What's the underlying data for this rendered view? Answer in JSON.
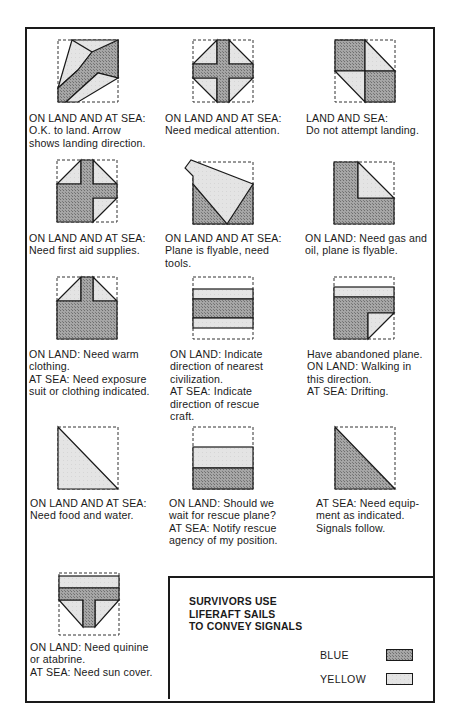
{
  "colors": {
    "blue": "#9a9a9a",
    "yellow": "#e3e3e3",
    "line": "#1a1a1a"
  },
  "signals": [
    {
      "id": "ok-to-land",
      "lines": [
        "ON LAND AND AT SEA:",
        "O.K. to land. Arrow",
        "shows landing direction."
      ]
    },
    {
      "id": "medical-attention",
      "lines": [
        "ON LAND AND AT SEA:",
        "Need medical attention."
      ]
    },
    {
      "id": "do-not-land",
      "lines": [
        "LAND AND SEA:",
        "Do not attempt landing."
      ]
    },
    {
      "id": "first-aid",
      "lines": [
        "ON LAND AND AT SEA:",
        "Need first aid supplies."
      ]
    },
    {
      "id": "need-tools",
      "lines": [
        "ON LAND AND AT SEA:",
        "Plane is flyable, need",
        "tools."
      ]
    },
    {
      "id": "gas-and-oil",
      "lines": [
        "ON LAND: Need gas and",
        "oil, plane is flyable."
      ]
    },
    {
      "id": "warm-clothing",
      "lines": [
        "ON LAND: Need warm",
        "clothing.",
        "AT SEA: Need exposure",
        "suit or clothing indicated."
      ]
    },
    {
      "id": "direction",
      "lines": [
        "ON LAND: Indicate",
        "direction of nearest",
        "civilization.",
        "AT SEA: Indicate",
        "direction of rescue",
        "craft."
      ]
    },
    {
      "id": "abandoned-plane",
      "lines": [
        "Have abandoned plane.",
        "ON LAND: Walking in",
        "this direction.",
        "AT SEA: Drifting."
      ]
    },
    {
      "id": "food-water",
      "lines": [
        "ON LAND AND AT SEA:",
        "Need food and water."
      ]
    },
    {
      "id": "wait-or-notify",
      "lines": [
        "ON LAND: Should we",
        "wait for rescue plane?",
        "AT SEA: Notify rescue",
        "agency of my position."
      ]
    },
    {
      "id": "equipment",
      "lines": [
        "AT SEA: Need equip-",
        "ment as indicated.",
        "Signals follow."
      ]
    },
    {
      "id": "quinine-sun-cover",
      "lines": [
        "ON LAND: Need quinine",
        "or atabrine.",
        "AT SEA: Need sun cover."
      ]
    }
  ],
  "legend": {
    "title_lines": [
      "SURVIVORS USE",
      "LIFERAFT SAILS",
      "TO CONVEY SIGNALS"
    ],
    "items": [
      {
        "label": "BLUE",
        "color_key": "blue"
      },
      {
        "label": "YELLOW",
        "color_key": "yellow"
      }
    ]
  }
}
